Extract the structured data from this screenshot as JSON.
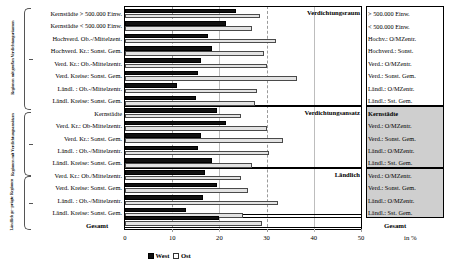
{
  "axis": {
    "ticks": [
      "0",
      "10",
      "20",
      "30",
      "40",
      "50"
    ],
    "unit_label": "in %",
    "min": 0,
    "max": 50
  },
  "legend": {
    "west_label": "West",
    "ost_label": "Ost",
    "west_color": "#111111",
    "ost_color": "#e3e3e3"
  },
  "side_brackets": [
    {
      "label": "Regionen mit großen Verdichtungsräumen"
    },
    {
      "label": "Regionen mit Verdichtungsansätzen"
    },
    {
      "label": "Ländlich ge- prägte Regionen"
    }
  ],
  "plot_captions": [
    "Verdichtungsraum",
    "Verdichtungsansatz",
    "Ländlich"
  ],
  "totals": {
    "left_label": "Gesamt",
    "right_label": "Gesamt"
  },
  "chart_data": {
    "type": "bar",
    "orientation": "horizontal",
    "title": "",
    "xlabel": "in %",
    "ylabel": "",
    "xlim": [
      0,
      50
    ],
    "grid": true,
    "legend_position": "bottom-left",
    "categories_left": [
      "Kernstädte > 500.000 Einw.",
      "Kernstädte < 500.000 Einw.",
      "Hochverd. Ob.-/Mittelzent.",
      "Hochverd. Kr.: Sonst. Gem.",
      "Verd. Kr.: Ob.-Mittelzentr.",
      "Verd. Kreise: Sonst. Gem.",
      "Ländl. : Ob.-/Mittelzentr.",
      "Ländl. Kreise: Sonst. Gem.",
      "Kernstädte",
      "Verd. Kr.: Ob-Mittelzentr.",
      "Verd. Kr.: Sonst. Gem.",
      "Ländl. : Ob.-/Mittelzentr.",
      "Ländl. Kreise: Sonst. Gem.",
      "Verd. Kr.: Ob./Mittelzentr.",
      "Verd. Kreise: Sonst. Gem.",
      "Ländl. : Ob.-/Mittelzentr.",
      "Ländl. Kreise: Sonst. Gem."
    ],
    "categories_right": [
      "> 500.000 Einw.",
      "< 500.000 Einw.",
      "Hochv.: O/MZentr.",
      "Hochverd.: Sonst.",
      "Verd.: O/MZentr.",
      "Verd.: Sonst. Gem.",
      "Ländl.: O/MZentr.",
      "Ländl.: Sst. Gem.",
      "Kernstädte",
      "Verd.: O/MZentr.",
      "Verd.: Sonst. Gem.",
      "Ländl.: O/MZentr.",
      "Ländl.: Sst. Gem.",
      "Verd.: O/MZentr.",
      "Verd.: Sonst. Gem.",
      "Ländl.: O/MZentr.",
      "Ländl.: Sst. Gem."
    ],
    "series": [
      {
        "name": "West",
        "values": [
          23.5,
          21.5,
          17.5,
          18.5,
          16.0,
          15.5,
          11.0,
          15.0,
          19.5,
          21.5,
          16.0,
          15.5,
          18.5,
          17.0,
          19.5,
          16.5,
          13.0
        ]
      },
      {
        "name": "Ost",
        "values": [
          28.5,
          27.0,
          32.0,
          29.5,
          30.0,
          36.5,
          28.0,
          27.5,
          24.5,
          30.0,
          33.5,
          30.5,
          27.0,
          24.5,
          26.0,
          32.5,
          25.0
        ]
      }
    ],
    "total": {
      "label": "Gesamt",
      "west": 20.0,
      "ost": 29.0
    },
    "groups": [
      {
        "name": "Verdichtungsraum",
        "start": 0,
        "count": 8
      },
      {
        "name": "Verdichtungsansatz",
        "start": 8,
        "count": 5
      },
      {
        "name": "Ländlich",
        "start": 13,
        "count": 4
      }
    ]
  }
}
